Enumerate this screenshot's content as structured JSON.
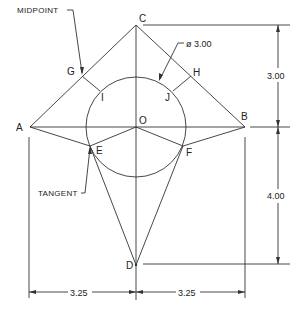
{
  "drawing": {
    "type": "geometric construction",
    "colors": {
      "line": "#333333",
      "background": "#ffffff"
    },
    "points": {
      "A": {
        "label": "A"
      },
      "B": {
        "label": "B"
      },
      "C": {
        "label": "C"
      },
      "D": {
        "label": "D"
      },
      "E": {
        "label": "E"
      },
      "F": {
        "label": "F"
      },
      "G": {
        "label": "G"
      },
      "H": {
        "label": "H"
      },
      "I": {
        "label": "I"
      },
      "J": {
        "label": "J"
      },
      "O": {
        "label": "O"
      }
    },
    "annotations": {
      "midpoint": "MIDPOINT",
      "tangent": "TANGENT",
      "diameter": "ø 3.00"
    },
    "dimensions": {
      "upper_vertical": "3.00",
      "lower_vertical": "4.00",
      "left_horizontal": "3.25",
      "right_horizontal": "3.25"
    }
  }
}
